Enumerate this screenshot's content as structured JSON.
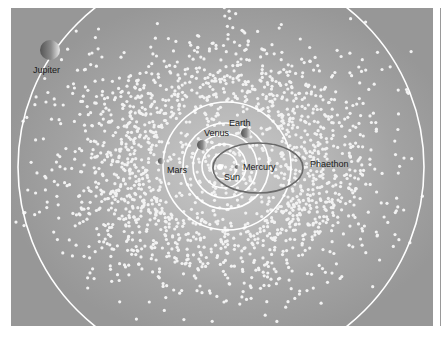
{
  "diagram": {
    "type": "solar-system-orbit-diagram",
    "colors": {
      "background_center": "#c9c9c9",
      "background_edge": "#979797",
      "orbit_line": "#ffffff",
      "phaethon_orbit": "#6a6a6a",
      "dots": "#f2f2f2",
      "label": "#1a1a1a"
    },
    "sun": {
      "label": "Sun",
      "cx": 220,
      "cy": 167,
      "r": 3
    },
    "orbits": [
      {
        "name": "Mercury",
        "cx": 224,
        "cy": 166,
        "r": 13
      },
      {
        "name": "Venus",
        "cx": 224,
        "cy": 166,
        "r": 22
      },
      {
        "name": "Earth",
        "cx": 225,
        "cy": 166,
        "r": 32
      },
      {
        "name": "Mars",
        "cx": 226,
        "cy": 166,
        "r": 43
      },
      {
        "name": "Mars-outer",
        "cx": 227,
        "cy": 166,
        "r": 64
      },
      {
        "name": "Jupiter",
        "cx": 221,
        "cy": 167,
        "r": 203
      }
    ],
    "planets": [
      {
        "name": "Mercury",
        "label": "Mercury",
        "cx": 237,
        "cy": 167,
        "r": 2,
        "label_x": 243,
        "label_y": 170
      },
      {
        "name": "Venus",
        "label": "Venus",
        "cx": 202,
        "cy": 145,
        "r": 5,
        "label_x": 204,
        "label_y": 136
      },
      {
        "name": "Earth",
        "label": "Earth",
        "cx": 246,
        "cy": 133,
        "r": 5,
        "label_x": 229,
        "label_y": 126
      },
      {
        "name": "Mars",
        "label": "Mars",
        "cx": 161,
        "cy": 161,
        "r": 3,
        "label_x": 167,
        "label_y": 173
      },
      {
        "name": "Jupiter",
        "label": "Jupiter",
        "cx": 50,
        "cy": 50,
        "r": 10,
        "label_x": 33,
        "label_y": 73
      }
    ],
    "sun_label": {
      "text": "Sun",
      "x": 224,
      "y": 180
    },
    "phaethon": {
      "label": "Phaethon",
      "cx": 258,
      "cy": 168,
      "rx": 45,
      "ry": 25,
      "label_x": 310,
      "label_y": 167
    },
    "asteroid_field": {
      "count": 2600,
      "seed": 7,
      "cx": 221,
      "cy": 166,
      "spread_x": 150,
      "spread_y": 115,
      "dot_radius": 1.6
    }
  }
}
